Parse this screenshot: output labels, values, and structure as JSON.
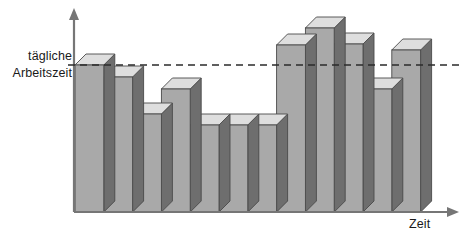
{
  "figure": {
    "title_hidden": "",
    "threshold_label_line1": "tägliche",
    "threshold_label_line2": "Arbeitszeit",
    "x_axis_label": "Zeit",
    "y_axis_label": ""
  },
  "colors": {
    "bar_front": "#a9a9a9",
    "bar_top": "#dedede",
    "bar_side": "#6e6e6e",
    "outline": "#4a4a4a",
    "axis": "#767676",
    "dashed_line": "#2b2b2b",
    "text": "#1a1a1a",
    "background": "#ffffff"
  },
  "geometry": {
    "baseline_y": 212,
    "axis_x": 74,
    "bar_start_x": 75,
    "bar_width": 28.8,
    "depth_x": 11,
    "depth_y": 11,
    "dashed_y": 65,
    "dashed_x_start": 68,
    "dashed_x_end": 459,
    "y_axis_top": 10,
    "x_axis_end": 457
  },
  "chart_data": {
    "type": "bar",
    "title": "",
    "xlabel": "Zeit",
    "ylabel": "",
    "grid": false,
    "legend": null,
    "annotations": [
      {
        "name": "threshold-line",
        "text": "tägliche Arbeitszeit",
        "kind": "horizontal-dashed-line",
        "y_value": 8.0
      }
    ],
    "ylim": [
      0,
      12.5
    ],
    "y_reference": {
      "label": "tägliche Arbeitszeit",
      "value": 8.0
    },
    "categories": [
      "1",
      "2",
      "3",
      "4",
      "5",
      "6",
      "7",
      "8",
      "9",
      "10",
      "11",
      "12"
    ],
    "values": [
      8.0,
      7.2,
      5.0,
      6.5,
      4.5,
      4.5,
      4.5,
      9.2,
      10.2,
      9.3,
      6.5,
      8.9
    ],
    "pixel_tops": [
      65,
      77,
      114,
      89,
      125,
      125,
      125,
      45,
      28,
      44,
      89,
      50
    ]
  }
}
